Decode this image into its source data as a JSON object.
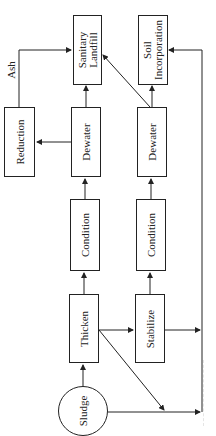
{
  "diagram": {
    "type": "flowchart",
    "orientation": "rotated-90-ccw",
    "nodes": {
      "sludge": "Sludge",
      "thicken": "Thicken",
      "stabilize": "Stabilize",
      "condition_1": "Condition",
      "condition_2": "Condition",
      "dewater_1": "Dewater",
      "dewater_2": "Dewater",
      "reduction": "Reduction",
      "sanitary_landfill_line1": "Sanitary",
      "sanitary_landfill_line2": "Landfill",
      "soil_incorporation_line1": "Soil",
      "soil_incorporation_line2": "Incorporation"
    },
    "edge_labels": {
      "ash": "Ash"
    },
    "edges": [
      [
        "Sludge",
        "Thicken"
      ],
      [
        "Sludge",
        "Soil Incorporation"
      ],
      [
        "Thicken",
        "Condition"
      ],
      [
        "Thicken",
        "Stabilize"
      ],
      [
        "Thicken",
        "Soil Incorporation"
      ],
      [
        "Condition",
        "Dewater"
      ],
      [
        "Dewater",
        "Sanitary Landfill"
      ],
      [
        "Dewater",
        "Reduction"
      ],
      [
        "Reduction",
        "Sanitary Landfill"
      ],
      [
        "Stabilize",
        "Condition"
      ],
      [
        "Stabilize",
        "Soil Incorporation"
      ],
      [
        "Condition",
        "Dewater"
      ],
      [
        "Dewater",
        "Soil Incorporation"
      ],
      [
        "Dewater",
        "Sanitary Landfill"
      ]
    ],
    "colors": {
      "stroke": "#222222",
      "background": "#ffffff"
    }
  }
}
